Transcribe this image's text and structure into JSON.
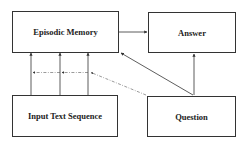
{
  "diagram": {
    "nodes": [
      {
        "id": "episodic_memory",
        "label": "Episodic Memory"
      },
      {
        "id": "answer",
        "label": "Answer"
      },
      {
        "id": "input_text_sequence",
        "label": "Input Text Sequence"
      },
      {
        "id": "question",
        "label": "Question"
      }
    ],
    "edges": [
      {
        "from": "episodic_memory",
        "to": "answer",
        "style": "solid"
      },
      {
        "from": "input_text_sequence",
        "to": "episodic_memory",
        "style": "solid",
        "count": 3
      },
      {
        "from": "question",
        "to": "episodic_memory",
        "style": "solid"
      },
      {
        "from": "question",
        "to": "answer",
        "style": "solid"
      },
      {
        "from": "question",
        "to": "input_to_memory_links",
        "style": "dash-dot"
      }
    ],
    "colors": {
      "stroke": "#333333",
      "text": "#222222",
      "background": "#ffffff"
    }
  }
}
